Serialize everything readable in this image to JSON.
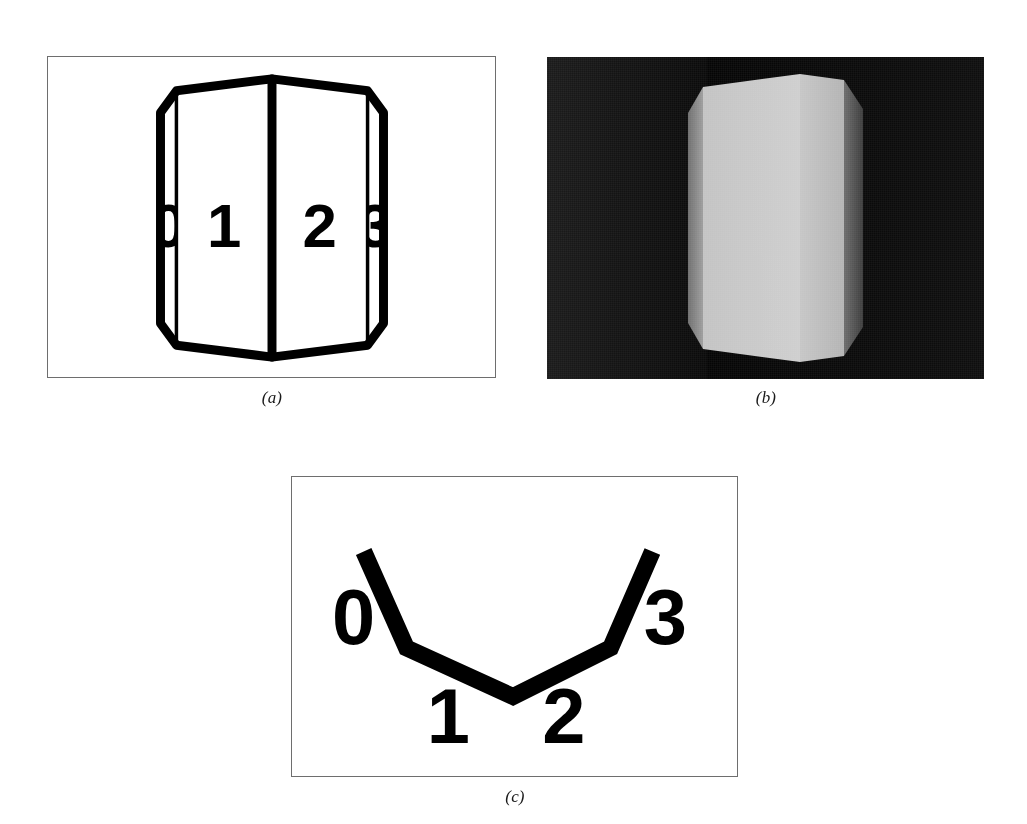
{
  "figure": {
    "background_color": "#ffffff",
    "panels": [
      {
        "id": "a",
        "caption": "(a)",
        "kind": "wireframe-line-drawing",
        "frame_color": "#6e6e6e",
        "background_color": "#ffffff",
        "stroke_color": "#000000",
        "labels": [
          "0",
          "1",
          "2",
          "3"
        ],
        "label_note": "faces 0 and 3 are nearly edge-on and their digits are clipped by the silhouette"
      },
      {
        "id": "b",
        "caption": "(b)",
        "kind": "shaded-rendering",
        "background_color": "#000000",
        "face_light_color": "#c9c9c9",
        "face_mid_color": "#b0b0b0",
        "face_dark_color": "#6b6b6b",
        "face_darker_color": "#3a3a3a"
      },
      {
        "id": "c",
        "caption": "(c)",
        "kind": "edge-vertex-diagram",
        "frame_color": "#6e6e6e",
        "background_color": "#ffffff",
        "stroke_color": "#000000",
        "labels": [
          "0",
          "1",
          "2",
          "3"
        ],
        "label_note": "cross-section polyline with four labelled segments"
      }
    ]
  },
  "panel_a": {
    "caption": "(a)",
    "label_0": "0",
    "label_1": "1",
    "label_2": "2",
    "label_3": "3"
  },
  "panel_b": {
    "caption": "(b)"
  },
  "panel_c": {
    "caption": "(c)",
    "label_0": "0",
    "label_1": "1",
    "label_2": "2",
    "label_3": "3"
  },
  "colors": {
    "ink": "#000000",
    "frame": "#6e6e6e",
    "paper": "#ffffff",
    "shade_bg": "#000000",
    "shade_light": "#c9c9c9",
    "shade_mid": "#b0b0b0",
    "shade_dark": "#6b6b6b",
    "shade_darker": "#3a3a3a"
  }
}
